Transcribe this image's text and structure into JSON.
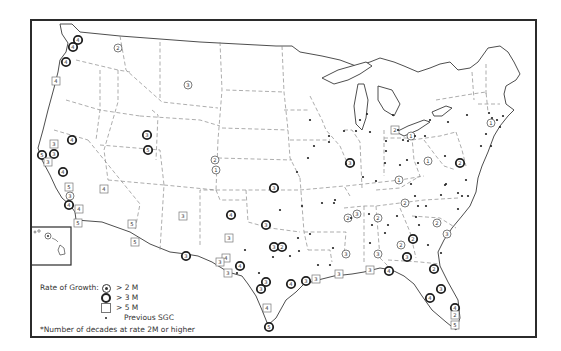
{
  "legend": {
    "title": "Rate of Growth:",
    "items": [
      {
        "symbol": "circle-with-dot",
        "label": "> 2 M"
      },
      {
        "symbol": "bold-circle",
        "label": "> 3 M"
      },
      {
        "symbol": "square",
        "label": "> 5 M"
      },
      {
        "symbol": "small-dot",
        "label": "Previous SGC"
      }
    ],
    "footnote": "*Number of decades at rate 2M or higher"
  },
  "symbols": {
    "circle_2m": [
      {
        "x": 118,
        "y": 48,
        "n": "2"
      },
      {
        "x": 188,
        "y": 85,
        "n": "3"
      },
      {
        "x": 215,
        "y": 160,
        "n": "2"
      },
      {
        "x": 216,
        "y": 170,
        "n": "1"
      },
      {
        "x": 70,
        "y": 196,
        "n": "3"
      },
      {
        "x": 428,
        "y": 161,
        "n": "1"
      },
      {
        "x": 411,
        "y": 136,
        "n": "1"
      },
      {
        "x": 399,
        "y": 180,
        "n": "1"
      },
      {
        "x": 378,
        "y": 218,
        "n": "2"
      },
      {
        "x": 348,
        "y": 218,
        "n": "2"
      },
      {
        "x": 357,
        "y": 214,
        "n": "3"
      },
      {
        "x": 405,
        "y": 203,
        "n": "2"
      },
      {
        "x": 437,
        "y": 223,
        "n": "2"
      },
      {
        "x": 447,
        "y": 234,
        "n": "3"
      },
      {
        "x": 401,
        "y": 245,
        "n": "2"
      },
      {
        "x": 346,
        "y": 254,
        "n": "3"
      },
      {
        "x": 378,
        "y": 254,
        "n": "3"
      },
      {
        "x": 491,
        "y": 123,
        "n": "1"
      }
    ],
    "circle_3m": [
      {
        "x": 78,
        "y": 40,
        "n": "4"
      },
      {
        "x": 73,
        "y": 47,
        "n": "4"
      },
      {
        "x": 66,
        "y": 62,
        "n": "4"
      },
      {
        "x": 72,
        "y": 140,
        "n": "4"
      },
      {
        "x": 42,
        "y": 155,
        "n": "5"
      },
      {
        "x": 54,
        "y": 154,
        "n": "3"
      },
      {
        "x": 63,
        "y": 172,
        "n": "4"
      },
      {
        "x": 69,
        "y": 205,
        "n": "4"
      },
      {
        "x": 147,
        "y": 135,
        "n": "3"
      },
      {
        "x": 148,
        "y": 150,
        "n": "5"
      },
      {
        "x": 274,
        "y": 188,
        "n": "3"
      },
      {
        "x": 231,
        "y": 215,
        "n": "4"
      },
      {
        "x": 266,
        "y": 225,
        "n": "3"
      },
      {
        "x": 274,
        "y": 247,
        "n": "3"
      },
      {
        "x": 282,
        "y": 247,
        "n": "2"
      },
      {
        "x": 186,
        "y": 256,
        "n": "3"
      },
      {
        "x": 240,
        "y": 266,
        "n": "4"
      },
      {
        "x": 266,
        "y": 282,
        "n": "3"
      },
      {
        "x": 261,
        "y": 289,
        "n": "3"
      },
      {
        "x": 291,
        "y": 284,
        "n": "4"
      },
      {
        "x": 306,
        "y": 281,
        "n": "3"
      },
      {
        "x": 269,
        "y": 327,
        "n": "5"
      },
      {
        "x": 389,
        "y": 271,
        "n": "4"
      },
      {
        "x": 413,
        "y": 239,
        "n": "2"
      },
      {
        "x": 407,
        "y": 257,
        "n": "3"
      },
      {
        "x": 434,
        "y": 269,
        "n": "2"
      },
      {
        "x": 441,
        "y": 289,
        "n": "3"
      },
      {
        "x": 430,
        "y": 298,
        "n": "4"
      },
      {
        "x": 455,
        "y": 308,
        "n": "4"
      },
      {
        "x": 350,
        "y": 163,
        "n": "3"
      },
      {
        "x": 460,
        "y": 163,
        "n": "2"
      }
    ],
    "square_5m": [
      {
        "x": 56,
        "y": 81,
        "n": "4"
      },
      {
        "x": 54,
        "y": 144,
        "n": "3"
      },
      {
        "x": 48,
        "y": 162,
        "n": "3"
      },
      {
        "x": 69,
        "y": 187,
        "n": "5"
      },
      {
        "x": 104,
        "y": 189,
        "n": "4"
      },
      {
        "x": 79,
        "y": 209,
        "n": "4"
      },
      {
        "x": 78,
        "y": 223,
        "n": "5"
      },
      {
        "x": 132,
        "y": 224,
        "n": "5"
      },
      {
        "x": 135,
        "y": 242,
        "n": "5"
      },
      {
        "x": 183,
        "y": 216,
        "n": "3"
      },
      {
        "x": 229,
        "y": 238,
        "n": "3"
      },
      {
        "x": 226,
        "y": 258,
        "n": "4"
      },
      {
        "x": 220,
        "y": 262,
        "n": "3"
      },
      {
        "x": 228,
        "y": 273,
        "n": "3"
      },
      {
        "x": 267,
        "y": 308,
        "n": "4"
      },
      {
        "x": 316,
        "y": 279,
        "n": "3"
      },
      {
        "x": 339,
        "y": 274,
        "n": "3"
      },
      {
        "x": 370,
        "y": 270,
        "n": "3"
      },
      {
        "x": 395,
        "y": 130,
        "n": "2"
      },
      {
        "x": 455,
        "y": 315,
        "n": "2"
      },
      {
        "x": 455,
        "y": 325,
        "n": "5"
      }
    ],
    "dots": [
      [
        360,
        120
      ],
      [
        367,
        114
      ],
      [
        393,
        115
      ],
      [
        356,
        131
      ],
      [
        329,
        136
      ],
      [
        314,
        146
      ],
      [
        346,
        164
      ],
      [
        344,
        131
      ],
      [
        370,
        132
      ],
      [
        386,
        141
      ],
      [
        398,
        130
      ],
      [
        403,
        140
      ],
      [
        408,
        141
      ],
      [
        415,
        136
      ],
      [
        425,
        136
      ],
      [
        430,
        120
      ],
      [
        448,
        122
      ],
      [
        467,
        115
      ],
      [
        489,
        113
      ],
      [
        492,
        118
      ],
      [
        497,
        120
      ],
      [
        500,
        127
      ],
      [
        503,
        116
      ],
      [
        486,
        134
      ],
      [
        491,
        146
      ],
      [
        481,
        146
      ],
      [
        418,
        163
      ],
      [
        445,
        156
      ],
      [
        386,
        151
      ],
      [
        407,
        160
      ],
      [
        446,
        184
      ],
      [
        411,
        184
      ],
      [
        415,
        196
      ],
      [
        445,
        185
      ],
      [
        462,
        196
      ],
      [
        468,
        196
      ],
      [
        458,
        193
      ],
      [
        441,
        195
      ],
      [
        418,
        206
      ],
      [
        426,
        206
      ],
      [
        416,
        217
      ],
      [
        419,
        225
      ],
      [
        397,
        216
      ],
      [
        372,
        225
      ],
      [
        369,
        214
      ],
      [
        351,
        218
      ],
      [
        370,
        243
      ],
      [
        385,
        233
      ],
      [
        388,
        225
      ],
      [
        428,
        245
      ],
      [
        441,
        253
      ],
      [
        458,
        209
      ],
      [
        466,
        180
      ],
      [
        376,
        181
      ],
      [
        335,
        200
      ],
      [
        322,
        203
      ],
      [
        302,
        206
      ],
      [
        280,
        210
      ],
      [
        310,
        234
      ],
      [
        298,
        238
      ],
      [
        333,
        248
      ],
      [
        334,
        203
      ],
      [
        273,
        257
      ],
      [
        259,
        273
      ],
      [
        299,
        251
      ],
      [
        290,
        256
      ],
      [
        237,
        273
      ],
      [
        245,
        250
      ],
      [
        318,
        265
      ],
      [
        330,
        265
      ],
      [
        363,
        177
      ],
      [
        385,
        163
      ],
      [
        400,
        165
      ],
      [
        329,
        142
      ],
      [
        297,
        172
      ],
      [
        308,
        158
      ],
      [
        310,
        120
      ]
    ]
  }
}
